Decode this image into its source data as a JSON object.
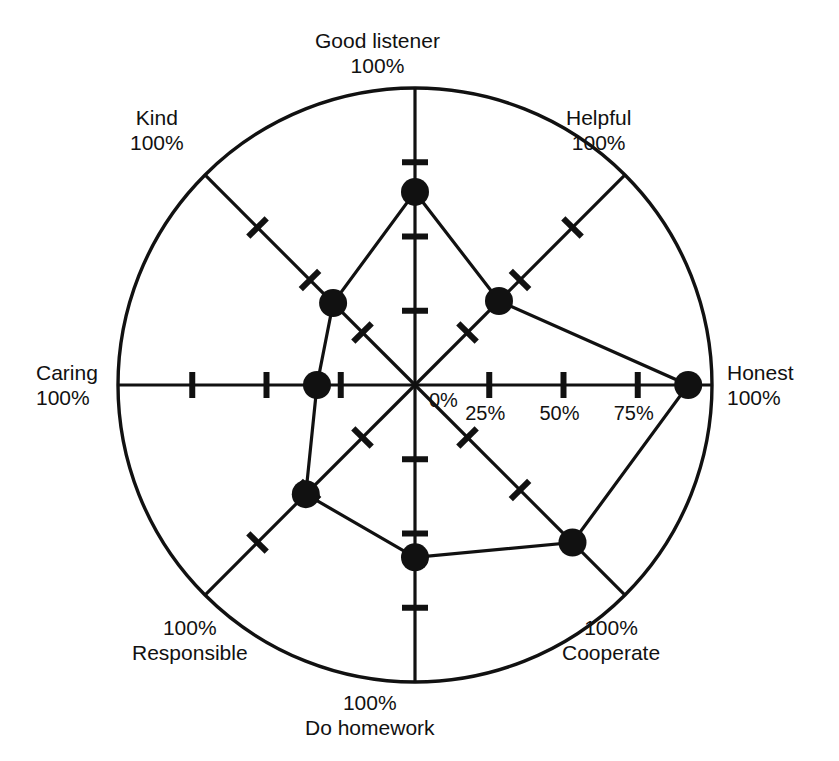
{
  "chart_data": {
    "type": "radar",
    "title": "",
    "subtitle": "",
    "xlabel": "",
    "ylabel": "",
    "grid": false,
    "legend": null,
    "radial_axis": {
      "min": 0,
      "max": 100,
      "unit": "%",
      "tick_values": [
        0,
        25,
        50,
        75,
        100
      ],
      "tick_labels_shown_on": "Honest",
      "tick_labels": [
        "0%",
        "25%",
        "50%",
        "75%"
      ],
      "outer_ring_label": "100%"
    },
    "categories": [
      "Good listener",
      "Helpful",
      "Honest",
      "Cooperate",
      "Do homework",
      "Responsible",
      "Caring",
      "Kind"
    ],
    "category_max_labels": [
      "100%",
      "100%",
      "100%",
      "100%",
      "100%",
      "100%",
      "100%",
      "100%"
    ],
    "series": [
      {
        "name": "Rating",
        "values": [
          65,
          40,
          92,
          75,
          58,
          52,
          33,
          39
        ]
      }
    ]
  },
  "axes": [
    {
      "name": "Good listener",
      "max": "100%",
      "value": 65,
      "angle_deg": 90,
      "label_pos": "top"
    },
    {
      "name": "Helpful",
      "max": "100%",
      "value": 40,
      "angle_deg": 45,
      "label_pos": "top-right"
    },
    {
      "name": "Honest",
      "max": "100%",
      "value": 92,
      "angle_deg": 0,
      "label_pos": "right"
    },
    {
      "name": "Cooperate",
      "max": "100%",
      "value": 75,
      "angle_deg": -45,
      "label_pos": "bottom-right"
    },
    {
      "name": "Do homework",
      "max": "100%",
      "value": 58,
      "angle_deg": -90,
      "label_pos": "bottom"
    },
    {
      "name": "Responsible",
      "max": "100%",
      "value": 52,
      "angle_deg": -135,
      "label_pos": "bottom-left"
    },
    {
      "name": "Caring",
      "max": "100%",
      "value": 33,
      "angle_deg": 180,
      "label_pos": "left"
    },
    {
      "name": "Kind",
      "max": "100%",
      "value": 39,
      "angle_deg": 135,
      "label_pos": "top-left"
    }
  ],
  "scale_ticks": [
    {
      "label": "0%",
      "value": 0
    },
    {
      "label": "25%",
      "value": 25
    },
    {
      "label": "50%",
      "value": 50
    },
    {
      "label": "75%",
      "value": 75
    }
  ],
  "style": {
    "stroke_color": "#111111",
    "marker_color": "#111111",
    "background": "#ffffff"
  }
}
